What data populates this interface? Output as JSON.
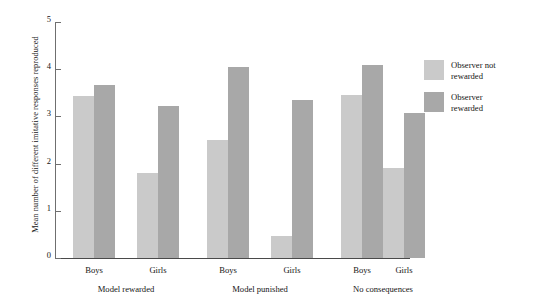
{
  "chart_data": {
    "type": "bar",
    "title": "",
    "subtitle": "",
    "xlabel": "",
    "ylabel": "Mean number of different imitative responses reproduced",
    "ylim": [
      0,
      5
    ],
    "ytick_labels": [
      "0",
      "1",
      "2",
      "3",
      "4",
      "5"
    ],
    "ytick_values": [
      0,
      1,
      2,
      3,
      4,
      5
    ],
    "grid": false,
    "legend_position": "right",
    "groups": [
      {
        "label": "Model rewarded",
        "subcategories": [
          "Boys",
          "Girls"
        ]
      },
      {
        "label": "Model punished",
        "subcategories": [
          "Boys",
          "Girls"
        ]
      },
      {
        "label": "No consequences",
        "subcategories": [
          "Boys",
          "Girls"
        ]
      }
    ],
    "categories": [
      "Model rewarded - Boys",
      "Model rewarded - Girls",
      "Model punished - Boys",
      "Model punished - Girls",
      "No consequences - Boys",
      "No consequences - Girls"
    ],
    "series": [
      {
        "name": "Observer not rewarded",
        "color": "#cacaca",
        "values": [
          3.43,
          1.8,
          2.5,
          0.47,
          3.45,
          1.9
        ]
      },
      {
        "name": "Observer rewarded",
        "color": "#a8a8a8",
        "values": [
          3.67,
          3.22,
          4.05,
          3.35,
          4.08,
          3.08
        ]
      }
    ]
  },
  "legend": {
    "items": [
      {
        "label_line1": "Observer not",
        "label_line2": "rewarded",
        "color": "#cacaca"
      },
      {
        "label_line1": "Observer",
        "label_line2": "rewarded",
        "color": "#a8a8a8"
      }
    ]
  },
  "axis": {
    "y_title": "Mean number of different imitative responses reproduced"
  }
}
